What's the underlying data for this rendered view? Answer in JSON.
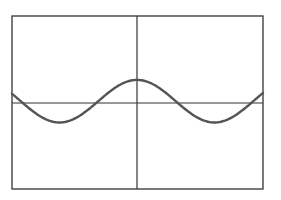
{
  "chart_data": {
    "type": "line",
    "title": "",
    "xlabel": "",
    "ylabel": "",
    "grid": false,
    "legend": null,
    "xlim": [
      -1,
      1
    ],
    "ylim": [
      -1,
      1
    ],
    "x": [
      -1.0,
      -0.75,
      -0.62,
      -0.5,
      -0.25,
      0.0,
      0.25,
      0.5,
      0.62,
      0.75,
      1.0
    ],
    "series": [
      {
        "name": "curve",
        "values": [
          0.25,
          -0.15,
          -0.22,
          -0.15,
          0.15,
          0.27,
          0.15,
          -0.15,
          -0.23,
          -0.15,
          0.23
        ]
      }
    ]
  },
  "colors": {
    "frame": "#333333",
    "axes": "#333333",
    "curve": "#555555",
    "background": "#ffffff"
  }
}
